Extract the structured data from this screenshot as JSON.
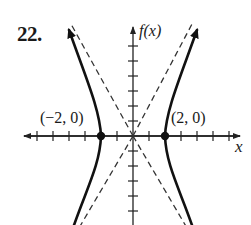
{
  "problem": {
    "number": "22.",
    "y_axis_label": "f(x)",
    "x_axis_label": "x",
    "points": [
      {
        "label": "(−2, 0)",
        "x": -2,
        "y": 0
      },
      {
        "label": "(2, 0)",
        "x": 2,
        "y": 0
      }
    ]
  },
  "graph": {
    "type": "hyperbola",
    "orientation": "horizontal transverse axis",
    "vertices": [
      [
        -2,
        0
      ],
      [
        2,
        0
      ]
    ],
    "center": [
      0,
      0
    ],
    "asymptotes": "dashed lines through origin, y = ±2x",
    "x_ticks": [
      -6,
      -5,
      -4,
      -3,
      -2,
      -1,
      1,
      2,
      3,
      4,
      5,
      6
    ],
    "y_ticks": [
      -6,
      -5,
      -4,
      -3,
      -2,
      -1,
      1,
      2,
      3,
      4,
      5,
      6
    ],
    "colors": {
      "curve": "#111111",
      "axes": "#222222",
      "asymptote": "#333333",
      "background": "#ffffff"
    }
  }
}
